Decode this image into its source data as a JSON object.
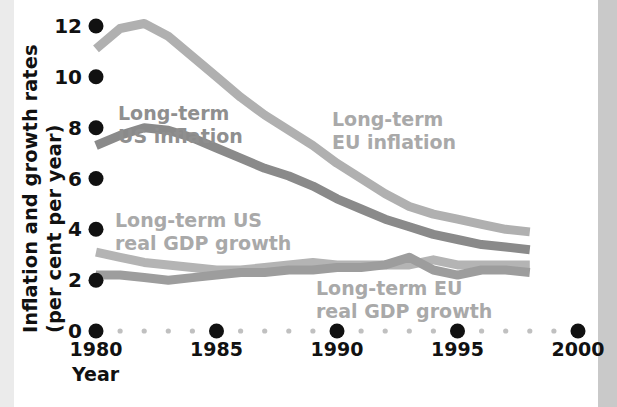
{
  "figure": {
    "background_color": "#ffffff",
    "left_strip_color": "#ebebeb",
    "right_strip_color": "#c9c9c9"
  },
  "chart_data": {
    "type": "line",
    "title": "",
    "xlabel": "Year",
    "ylabel": "Inflation and growth rates (per cent per year)",
    "ylabel_line1": "Inflation and growth rates",
    "ylabel_line2": "(per cent per year)",
    "xlim": [
      1980,
      2000
    ],
    "ylim": [
      0,
      12
    ],
    "xticks": [
      1980,
      1985,
      1990,
      1995,
      2000
    ],
    "xtick_labels": [
      "1980",
      "1985",
      "1990",
      "1995",
      "2000"
    ],
    "yticks": [
      0,
      2,
      4,
      6,
      8,
      10,
      12
    ],
    "ytick_labels": [
      "0",
      "2",
      "4",
      "6",
      "8",
      "10",
      "12"
    ],
    "grid": false,
    "legend": "inline-annotations",
    "x": [
      1980,
      1981,
      1982,
      1983,
      1984,
      1985,
      1986,
      1987,
      1988,
      1989,
      1990,
      1991,
      1992,
      1993,
      1994,
      1995,
      1996,
      1997,
      1998
    ],
    "series": [
      {
        "name": "Long-term EU inflation",
        "color": "#b0b0b0",
        "label_lines": [
          "Long-term",
          "EU inflation"
        ],
        "label_color": "#a9a9a9",
        "values": [
          11.1,
          11.9,
          12.1,
          11.6,
          10.8,
          10.0,
          9.2,
          8.5,
          7.9,
          7.3,
          6.6,
          6.0,
          5.4,
          4.9,
          4.6,
          4.4,
          4.2,
          4.0,
          3.9
        ]
      },
      {
        "name": "Long-term US inflation",
        "color": "#8a8a8a",
        "label_lines": [
          "Long-term",
          "US inflation"
        ],
        "label_color": "#8f8f8f",
        "values": [
          7.3,
          7.7,
          8.0,
          7.9,
          7.6,
          7.2,
          6.8,
          6.4,
          6.1,
          5.7,
          5.2,
          4.8,
          4.4,
          4.1,
          3.8,
          3.6,
          3.4,
          3.3,
          3.2
        ]
      },
      {
        "name": "Long-term US real GDP growth",
        "color": "#b4b4b4",
        "label_lines": [
          "Long-term US",
          "real GDP growth"
        ],
        "label_color": "#a9a9a9",
        "values": [
          3.1,
          2.9,
          2.7,
          2.6,
          2.5,
          2.4,
          2.4,
          2.5,
          2.6,
          2.7,
          2.6,
          2.6,
          2.6,
          2.6,
          2.8,
          2.6,
          2.6,
          2.6,
          2.6
        ]
      },
      {
        "name": "Long-term EU real GDP growth",
        "color": "#9d9d9d",
        "label_lines": [
          "Long-term EU",
          "real GDP growth"
        ],
        "label_color": "#a9a9a9",
        "values": [
          2.2,
          2.2,
          2.1,
          2.0,
          2.1,
          2.2,
          2.3,
          2.3,
          2.4,
          2.4,
          2.5,
          2.5,
          2.6,
          2.9,
          2.4,
          2.2,
          2.4,
          2.4,
          2.3
        ]
      }
    ]
  }
}
